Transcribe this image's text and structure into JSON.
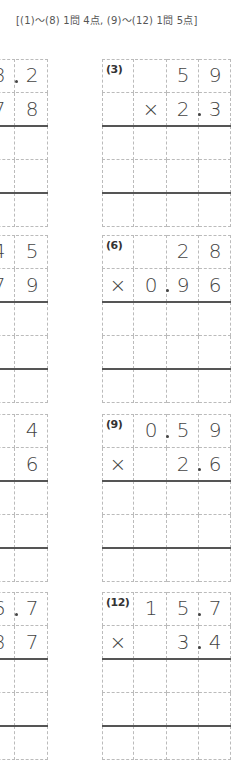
{
  "header": {
    "text": "[(1)〜(8)  1問  4点, (9)〜(12)  1問  5点]"
  },
  "layout": {
    "block_tops": [
      59,
      235,
      414,
      592
    ],
    "row_height": 33.6,
    "left_col_x": [
      -17,
      16
    ],
    "right_col_x": [
      102,
      135,
      167,
      199
    ]
  },
  "left_problems": [
    {
      "id": "1",
      "row1": [
        "8",
        "2"
      ],
      "row1_decimal": true,
      "row2": [
        "7",
        "8"
      ],
      "row2_decimal": false
    },
    {
      "id": "4",
      "row1": [
        "4",
        "5"
      ],
      "row1_decimal": false,
      "row2": [
        "7",
        "9"
      ],
      "row2_decimal": false
    },
    {
      "id": "7",
      "row1": [
        "",
        "4"
      ],
      "row1_decimal": false,
      "row2": [
        "",
        "6"
      ],
      "row2_decimal": false
    },
    {
      "id": "10",
      "row1": [
        "6",
        "7"
      ],
      "row1_decimal": true,
      "row2": [
        "8",
        "7"
      ],
      "row2_decimal": false
    }
  ],
  "right_problems": [
    {
      "label": "(3)",
      "row1": [
        "",
        "",
        "5",
        "9"
      ],
      "row1_decimal_after": -1,
      "row2": [
        "",
        "×",
        "2",
        "3"
      ],
      "row2_decimal_after": 2
    },
    {
      "label": "(6)",
      "row1": [
        "",
        "",
        "2",
        "8"
      ],
      "row1_decimal_after": -1,
      "row2": [
        "×",
        "0",
        "9",
        "6"
      ],
      "row2_decimal_after": 1
    },
    {
      "label": "(9)",
      "row1": [
        "",
        "0",
        "5",
        "9"
      ],
      "row1_decimal_after": 1,
      "row2": [
        "×",
        "",
        "2",
        "6"
      ],
      "row2_decimal_after": 2
    },
    {
      "label": "(12)",
      "row1": [
        "",
        "1",
        "5",
        "7"
      ],
      "row1_decimal_after": 2,
      "row2": [
        "×",
        "",
        "3",
        "4"
      ],
      "row2_decimal_after": 2
    }
  ]
}
